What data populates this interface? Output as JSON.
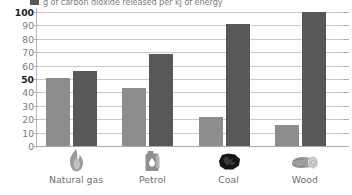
{
  "legend": {
    "swatch_color": "#595959",
    "label": "g of carbon dioxide released per kJ of energy"
  },
  "axis": {
    "y_ticks": [
      "100",
      "90",
      "80",
      "70",
      "60",
      "50",
      "40",
      "30",
      "20",
      "10",
      "0"
    ],
    "y_bold_ticks": [
      "100",
      "50"
    ]
  },
  "colors": {
    "series_light": "#8d8d8d",
    "series_dark": "#585858",
    "gridline": "#c9c9c9",
    "tick_text": "#7a7a7a"
  },
  "categories": [
    {
      "label": "Natural gas",
      "icon": "flame-icon"
    },
    {
      "label": "Petrol",
      "icon": "jerry-can-icon"
    },
    {
      "label": "Coal",
      "icon": "coal-lump-icon"
    },
    {
      "label": "Wood",
      "icon": "log-icon"
    }
  ],
  "chart_data": {
    "type": "bar",
    "title": "",
    "subtitle": "",
    "xlabel": "",
    "ylabel": "",
    "ylim": [
      0,
      100
    ],
    "yticks": [
      0,
      10,
      20,
      30,
      40,
      50,
      60,
      70,
      80,
      90,
      100
    ],
    "grid": true,
    "legend_position": "top-left",
    "categories": [
      "Natural gas",
      "Petrol",
      "Coal",
      "Wood"
    ],
    "series": [
      {
        "name": "series-light",
        "color": "#8d8d8d",
        "values": [
          51,
          43,
          22,
          16
        ]
      },
      {
        "name": "series-dark",
        "color": "#585858",
        "values": [
          56,
          69,
          91,
          100
        ]
      }
    ],
    "annotations": [
      "g of carbon dioxide released per kJ of energy"
    ]
  }
}
